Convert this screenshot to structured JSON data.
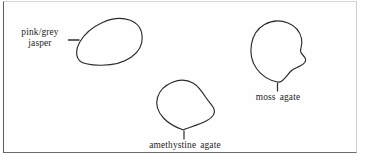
{
  "figure": {
    "kind": "line-drawing-plate",
    "background_color": "#ffffff",
    "ink_color": "#262626",
    "frame_color": "#5c5c5c",
    "specimens": [
      {
        "id": "pink-grey-jasper",
        "label_line_1": "pink/grey",
        "label_line_2": "jasper",
        "label_full": "pink/grey jasper",
        "leader": "horizontal-dash",
        "shape": "teardrop-oval-tapering-lower-left"
      },
      {
        "id": "amethystine-agate",
        "label_line_1": "amethystine agate",
        "label_full": "amethystine agate",
        "leader": "vertical-tick",
        "shape": "rounded-triangular-blob-pointed-base"
      },
      {
        "id": "moss-agate",
        "label_line_1": "moss agate",
        "label_full": "moss agate",
        "leader": "vertical-tick",
        "shape": "rounded-blob-with-right-notch"
      }
    ]
  }
}
